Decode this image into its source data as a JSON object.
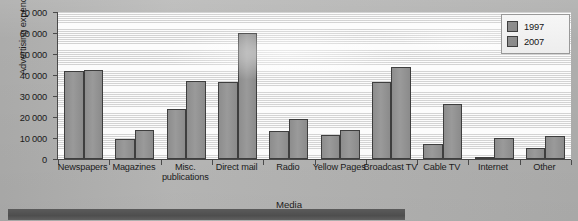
{
  "chart_data": {
    "type": "bar",
    "title": "",
    "xlabel": "Media",
    "ylabel": "Advertising expenditure ($m)",
    "ylim": [
      0,
      70000
    ],
    "ytick_step": 10000,
    "yticks": [
      "0",
      "10000",
      "20000",
      "30000",
      "40000",
      "50000",
      "60000",
      "70000"
    ],
    "grid": true,
    "grid_orientation": "horizontal",
    "legend_position": "top-right",
    "categories": [
      "Newspapers",
      "Magazines",
      "Misc. publications",
      "Direct mail",
      "Radio",
      "Yellow Pages",
      "Broadcast TV",
      "Cable TV",
      "Internet",
      "Other"
    ],
    "series": [
      {
        "name": "1997",
        "color": "#8f8f8f",
        "values": [
          41800,
          9700,
          24000,
          36800,
          13300,
          11200,
          36600,
          7000,
          600,
          5200
        ]
      },
      {
        "name": "2007",
        "color": "#8f8f8f",
        "values": [
          42200,
          13700,
          37300,
          60000,
          19000,
          14000,
          44000,
          26000,
          10200,
          11000
        ]
      }
    ]
  },
  "legend": {
    "items": [
      {
        "label": "1997"
      },
      {
        "label": "2007"
      }
    ]
  }
}
